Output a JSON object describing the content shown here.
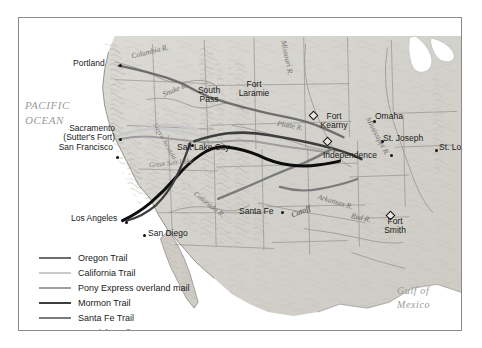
{
  "map": {
    "title": "Western Trails of the United States",
    "frame_color": "#8a8a8a",
    "background": "#ffffff"
  },
  "oceans": [
    {
      "name": "pacific-ocean",
      "line1": "PACIFIC",
      "line2": "OCEAN"
    },
    {
      "name": "gulf-of-mexico",
      "line1": "Gulf of",
      "line2": "Mexico"
    }
  ],
  "cities": [
    {
      "name": "portland",
      "label": "Portland"
    },
    {
      "name": "sacramento",
      "label": "Sacramento"
    },
    {
      "name": "sutters-fort",
      "label": "(Sutter's Fort)"
    },
    {
      "name": "san-francisco",
      "label": "San Francisco"
    },
    {
      "name": "salt-lake-city",
      "label": "Salt Lake City"
    },
    {
      "name": "south-pass",
      "label_line1": "South",
      "label_line2": "Pass"
    },
    {
      "name": "fort-laramie",
      "label_line1": "Fort",
      "label_line2": "Laramie"
    },
    {
      "name": "fort-kearny",
      "label_line1": "Fort",
      "label_line2": "Kearny"
    },
    {
      "name": "omaha",
      "label": "Omaha"
    },
    {
      "name": "st-joseph",
      "label": "St. Joseph"
    },
    {
      "name": "independence",
      "label": "Independence"
    },
    {
      "name": "st-louis",
      "label": "St. Louis"
    },
    {
      "name": "fort-smith",
      "label_line1": "Fort",
      "label_line2": "Smith"
    },
    {
      "name": "santa-fe",
      "label": "Santa Fe"
    },
    {
      "name": "los-angeles",
      "label": "Los Angeles"
    },
    {
      "name": "san-diego",
      "label": "San Diego"
    }
  ],
  "rivers": [
    {
      "name": "columbia-river",
      "label": "Columbia R."
    },
    {
      "name": "snake-river",
      "label": "Snake R."
    },
    {
      "name": "platte-river",
      "label": "Platte R."
    },
    {
      "name": "missouri-river",
      "label": "Missouri R."
    },
    {
      "name": "mississippi-river",
      "label": "Mississippi R."
    },
    {
      "name": "arkansas-river",
      "label": "Arkansas R."
    },
    {
      "name": "colorado-river",
      "label": "Colorado R."
    },
    {
      "name": "red-river",
      "label": "Red R."
    }
  ],
  "regions": [
    {
      "name": "great-salt-lake",
      "label": "Great Salt Lake"
    },
    {
      "name": "sierra-nevada",
      "label": "Sierra Nevada"
    }
  ],
  "annotations": [
    {
      "name": "cimarron-cutoff",
      "label": "Cutoff"
    }
  ],
  "legend": {
    "items": [
      {
        "name": "oregon-trail",
        "label": "Oregon Trail",
        "color": "#6e6e6e",
        "width": 2.4
      },
      {
        "name": "california-trail",
        "label": "California Trail",
        "color": "#c9c9c9",
        "width": 2.4
      },
      {
        "name": "pony-express",
        "label": "Pony Express overland mail",
        "color": "#9e9e9e",
        "width": 2.0
      },
      {
        "name": "mormon-trail",
        "label": "Mormon Trail",
        "color": "#3d3d3d",
        "width": 2.6
      },
      {
        "name": "santa-fe-trail",
        "label": "Santa Fe Trail",
        "color": "#7b7b7b",
        "width": 2.4
      },
      {
        "name": "spanish-trail",
        "label": "Spanish Trail",
        "color": "#0d0d0d",
        "width": 3.0
      }
    ]
  }
}
